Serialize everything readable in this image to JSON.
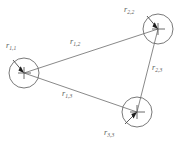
{
  "figure": {
    "background_color": "#ffffff",
    "line_color": "#6b6b6b",
    "label_color": "#5d5d5d",
    "arrow_color": "#1d1d1d",
    "width": 184,
    "height": 143
  },
  "bodies": [
    {
      "id": "body-1",
      "label": "r",
      "subscript": "1,1",
      "label_full": "r1,1",
      "cx": 24,
      "cy": 73,
      "r": 15,
      "label_x": 6,
      "label_y": 48,
      "vector_tail_x": 13,
      "vector_tail_y": 60,
      "vector_tip_x": 24,
      "vector_tip_y": 73
    },
    {
      "id": "body-2",
      "label": "r",
      "subscript": "2,2",
      "label_full": "r2,2",
      "cx": 158,
      "cy": 29,
      "r": 15,
      "label_x": 124,
      "label_y": 12,
      "vector_tail_x": 147,
      "vector_tail_y": 16,
      "vector_tip_x": 158,
      "vector_tip_y": 29
    },
    {
      "id": "body-3",
      "label": "r",
      "subscript": "3,3",
      "label_full": "r3,3",
      "cx": 137,
      "cy": 112,
      "r": 15,
      "label_x": 104,
      "label_y": 135,
      "vector_tail_x": 125,
      "vector_tail_y": 124,
      "vector_tip_x": 137,
      "vector_tip_y": 112
    }
  ],
  "edges": [
    {
      "id": "edge-1-2",
      "label": "r",
      "subscript": "1,2",
      "label_full": "r1,2",
      "from": "body-1",
      "to": "body-2",
      "x1": 24,
      "y1": 73,
      "x2": 158,
      "y2": 29,
      "label_x": 70,
      "label_y": 44
    },
    {
      "id": "edge-2-3",
      "label": "r",
      "subscript": "2,3",
      "label_full": "r2,3",
      "from": "body-2",
      "to": "body-3",
      "x1": 158,
      "y1": 29,
      "x2": 137,
      "y2": 112,
      "label_x": 152,
      "label_y": 70
    },
    {
      "id": "edge-1-3",
      "label": "r",
      "subscript": "1,3",
      "label_full": "r1,3",
      "from": "body-1",
      "to": "body-3",
      "x1": 24,
      "y1": 73,
      "x2": 137,
      "y2": 112,
      "label_x": 62,
      "label_y": 96
    }
  ]
}
